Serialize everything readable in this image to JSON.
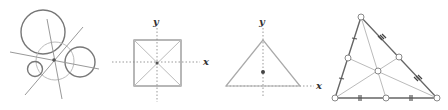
{
  "figures": [
    {
      "id": "circles-and-lines",
      "description": "Four circles with three intersecting lines through a common point",
      "circles": [
        {
          "cx": 43,
          "cy": 32,
          "r": 22,
          "stroke": "#777777",
          "width": 1.4
        },
        {
          "cx": 55,
          "cy": 60,
          "r": 19,
          "stroke": "#bbbbbb",
          "width": 1.0
        },
        {
          "cx": 80,
          "cy": 62,
          "r": 15,
          "stroke": "#777777",
          "width": 1.4
        },
        {
          "cx": 35,
          "cy": 69,
          "r": 8,
          "stroke": "#777777",
          "width": 1.4
        }
      ],
      "center_point": {
        "x": 54,
        "y": 60
      }
    },
    {
      "id": "square-with-axes",
      "axis_x_label": "x",
      "axis_y_label": "y"
    },
    {
      "id": "triangle-with-axes",
      "axis_x_label": "x",
      "axis_y_label": "y"
    },
    {
      "id": "triangle-with-medians",
      "description": "Triangle with medians, midpoints marked with open circles and equal-length tick marks"
    }
  ],
  "colors": {
    "dark_line": "#666666",
    "light_line": "#bbbbbb",
    "dotted_axis": "#999999",
    "point": "#555555"
  }
}
